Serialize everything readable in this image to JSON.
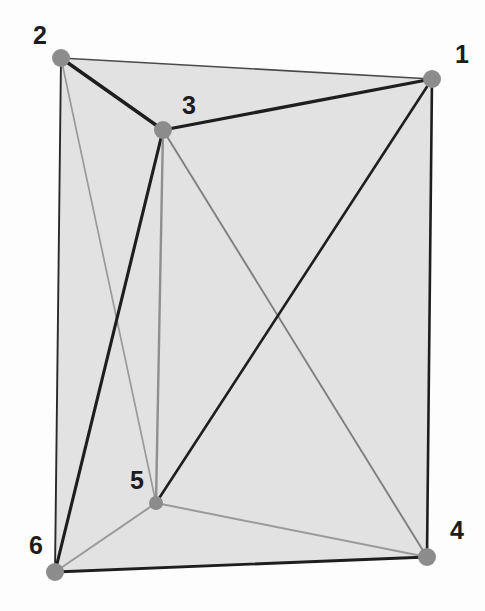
{
  "figure": {
    "canvas": {
      "width": 485,
      "height": 611
    },
    "background_color": "#fdfdfd",
    "face_fill_color": "#e2e2e2",
    "vertex_color": "#8c8c8c",
    "edge_color_dark": "#1e1e1e",
    "edge_color_light": "#9a9a9a",
    "label_color": "#1d1d1d"
  },
  "chart_data": {
    "type": "scatter",
    "xlabel": "",
    "ylabel": "",
    "xlim": [
      0,
      485
    ],
    "ylim": [
      0,
      611
    ],
    "grid": false,
    "legend": "none",
    "nodes": [
      {
        "id": "1",
        "label": "1",
        "x": 432,
        "y": 79,
        "label_x": 455,
        "label_y": 42,
        "radius": 9
      },
      {
        "id": "2",
        "label": "2",
        "x": 61,
        "y": 58,
        "label_x": 33,
        "label_y": 23,
        "radius": 9
      },
      {
        "id": "3",
        "label": "3",
        "x": 163,
        "y": 130,
        "label_x": 182,
        "label_y": 93,
        "radius": 9
      },
      {
        "id": "4",
        "label": "4",
        "x": 427,
        "y": 557,
        "label_x": 450,
        "label_y": 518,
        "radius": 9
      },
      {
        "id": "5",
        "label": "5",
        "x": 156,
        "y": 503,
        "label_x": 130,
        "label_y": 468,
        "radius": 7
      },
      {
        "id": "6",
        "label": "6",
        "x": 55,
        "y": 572,
        "label_x": 29,
        "label_y": 533,
        "radius": 9
      }
    ],
    "edges": [
      {
        "from": "2",
        "to": "1",
        "style": "thin",
        "color": "#4a4a4a",
        "width": 1.6
      },
      {
        "from": "2",
        "to": "3",
        "style": "thick",
        "color": "#1e1e1e",
        "width": 3.4
      },
      {
        "from": "3",
        "to": "1",
        "style": "thick",
        "color": "#1e1e1e",
        "width": 3.2
      },
      {
        "from": "2",
        "to": "6",
        "style": "thin",
        "color": "#2a2a2a",
        "width": 1.9
      },
      {
        "from": "2",
        "to": "5",
        "style": "light",
        "color": "#9a9a9a",
        "width": 1.7
      },
      {
        "from": "3",
        "to": "6",
        "style": "thick",
        "color": "#1e1e1e",
        "width": 3.1
      },
      {
        "from": "3",
        "to": "5",
        "style": "light",
        "color": "#8f8f8f",
        "width": 2.4
      },
      {
        "from": "3",
        "to": "4",
        "style": "light",
        "color": "#7f7f7f",
        "width": 1.9
      },
      {
        "from": "1",
        "to": "5",
        "style": "thick",
        "color": "#1e1e1e",
        "width": 2.6
      },
      {
        "from": "1",
        "to": "4",
        "style": "thick",
        "color": "#1e1e1e",
        "width": 2.6
      },
      {
        "from": "6",
        "to": "5",
        "style": "light",
        "color": "#9a9a9a",
        "width": 2.0
      },
      {
        "from": "6",
        "to": "4",
        "style": "thick",
        "color": "#1e1e1e",
        "width": 2.8
      },
      {
        "from": "5",
        "to": "4",
        "style": "light",
        "color": "#9a9a9a",
        "width": 2.0
      }
    ],
    "faces": [
      {
        "name": "outer-hull",
        "nodes": [
          "2",
          "1",
          "4",
          "6"
        ],
        "fill": "#e2e2e2"
      },
      {
        "name": "face-2-3-5-6",
        "nodes": [
          "2",
          "3",
          "5",
          "6"
        ],
        "fill": "#e2e2e2"
      }
    ]
  },
  "bleed_text": {
    "note": "faint reverse-side scan bleed-through, illegible",
    "lines": [
      "a partial line of reversed show-through text",
      "another faint reversed line of body text",
      "further illegible reversed characters here",
      "continuing ghost text from the page behind",
      "more faint reversed show-through lettering",
      "the final faded reversed line of text"
    ]
  }
}
